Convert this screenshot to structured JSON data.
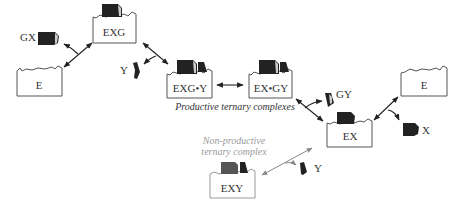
{
  "diagram": {
    "type": "enzyme ternary-complex mechanism",
    "nodes": {
      "e_left": "E",
      "exg": "EXG",
      "exg_y": "EXG•Y",
      "ex_gy": "EX•GY",
      "ex": "EX",
      "e_right": "E",
      "exy": "EXY"
    },
    "ligands": {
      "gx": "GX",
      "y_top": "Y",
      "gy": "GY",
      "x": "X",
      "y_bottom": "Y"
    },
    "captions": {
      "productive": "Productive ternary complexes",
      "nonproductive_line1": "Non-productive",
      "nonproductive_line2": "ternary complex"
    },
    "colors": {
      "outline": "#555555",
      "ligand": "#222222",
      "muted": "#9a9a9a"
    }
  }
}
